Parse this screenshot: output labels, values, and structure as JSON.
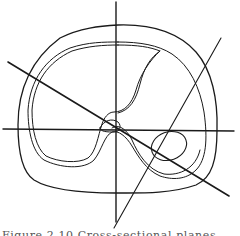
{
  "figure": {
    "caption_partial": "Figure 2.10  Cross-sectional planes",
    "stroke_color": "#1a1a1a",
    "background": "#ffffff"
  },
  "diagram": {
    "elements": [
      {
        "id": "outer-contour",
        "type": "closed-curve"
      },
      {
        "id": "inner-contour",
        "type": "double-closed-curve"
      },
      {
        "id": "small-oval",
        "type": "ellipse"
      },
      {
        "id": "vertical-axis",
        "type": "line"
      },
      {
        "id": "horizontal-axis",
        "type": "line"
      },
      {
        "id": "diagonal-line-1",
        "type": "line"
      },
      {
        "id": "diagonal-line-2",
        "type": "line"
      }
    ]
  }
}
